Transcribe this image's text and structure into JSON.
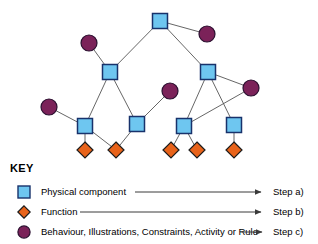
{
  "diagram": {
    "title": "",
    "nodes": [
      {
        "id": "sq-top",
        "type": "physical-component",
        "x": 160,
        "y": 21
      },
      {
        "id": "circ-tr",
        "type": "behaviour",
        "x": 207,
        "y": 34
      },
      {
        "id": "circ-tl",
        "type": "behaviour",
        "x": 89,
        "y": 43
      },
      {
        "id": "sq-ml",
        "type": "physical-component",
        "x": 110,
        "y": 72
      },
      {
        "id": "sq-mr",
        "type": "physical-component",
        "x": 208,
        "y": 72
      },
      {
        "id": "circ-mid",
        "type": "behaviour",
        "x": 170,
        "y": 91
      },
      {
        "id": "circ-r",
        "type": "behaviour",
        "x": 251,
        "y": 88
      },
      {
        "id": "circ-l",
        "type": "behaviour",
        "x": 49,
        "y": 107
      },
      {
        "id": "sq-b1",
        "type": "physical-component",
        "x": 85,
        "y": 126
      },
      {
        "id": "sq-b2",
        "type": "physical-component",
        "x": 137,
        "y": 124
      },
      {
        "id": "sq-b3",
        "type": "physical-component",
        "x": 184,
        "y": 126
      },
      {
        "id": "sq-b4",
        "type": "physical-component",
        "x": 234,
        "y": 125
      },
      {
        "id": "di-1",
        "type": "function",
        "x": 85,
        "y": 150
      },
      {
        "id": "di-2",
        "type": "function",
        "x": 116,
        "y": 150
      },
      {
        "id": "di-3",
        "type": "function",
        "x": 171,
        "y": 150
      },
      {
        "id": "di-4",
        "type": "function",
        "x": 197,
        "y": 150
      },
      {
        "id": "di-5",
        "type": "function",
        "x": 234,
        "y": 150
      }
    ],
    "edges": [
      {
        "from": "sq-top",
        "to": "circ-tr"
      },
      {
        "from": "sq-top",
        "to": "sq-ml"
      },
      {
        "from": "sq-top",
        "to": "sq-mr"
      },
      {
        "from": "circ-tl",
        "to": "sq-ml"
      },
      {
        "from": "sq-ml",
        "to": "sq-b1"
      },
      {
        "from": "sq-ml",
        "to": "sq-b2"
      },
      {
        "from": "circ-l",
        "to": "sq-b1"
      },
      {
        "from": "sq-b1",
        "to": "di-1"
      },
      {
        "from": "sq-b1",
        "to": "di-2"
      },
      {
        "from": "sq-b2",
        "to": "di-2"
      },
      {
        "from": "sq-b2",
        "to": "circ-mid"
      },
      {
        "from": "sq-mr",
        "to": "sq-b3"
      },
      {
        "from": "sq-mr",
        "to": "sq-b4"
      },
      {
        "from": "sq-mr",
        "to": "circ-r"
      },
      {
        "from": "circ-r",
        "to": "sq-b3"
      },
      {
        "from": "sq-b3",
        "to": "di-3"
      },
      {
        "from": "sq-b3",
        "to": "di-4"
      },
      {
        "from": "sq-b4",
        "to": "di-5"
      }
    ]
  },
  "legend": {
    "title": "KEY",
    "rows": [
      {
        "icon": "square-icon",
        "label": "Physical component",
        "step": "Step a)"
      },
      {
        "icon": "diamond-icon",
        "label": "Function",
        "step": "Step b)"
      },
      {
        "icon": "circle-icon",
        "label": "Behaviour, Illustrations, Constraints, Activity or Rule",
        "step": "Step c)"
      }
    ]
  },
  "colors": {
    "physical_component_fill": "#6EC6F0",
    "physical_component_stroke": "#18326B",
    "function_fill": "#E8631A",
    "function_stroke": "#1B1B1B",
    "behaviour_fill": "#7B2259",
    "behaviour_stroke": "#2B1030",
    "edge": "#555555",
    "text": "#000000",
    "background": "#FFFFFF"
  }
}
